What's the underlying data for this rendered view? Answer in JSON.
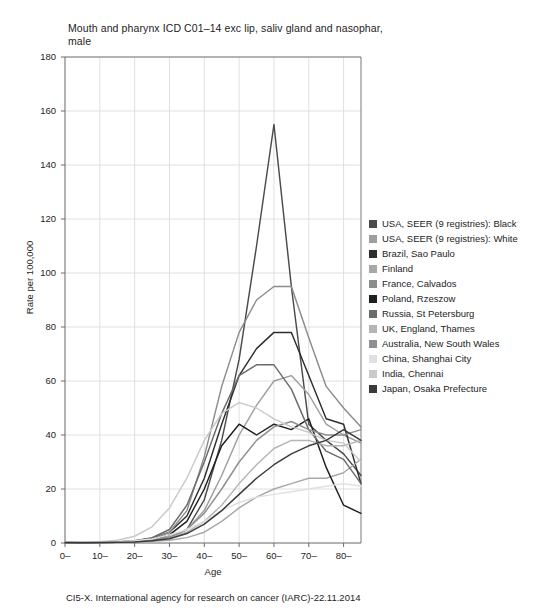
{
  "title": "Mouth and pharynx ICD C01–14 exc lip, saliv gland and nasophar, male",
  "footer": "CI5-X. International agency for research on cancer (IARC)-22.11.2014",
  "axes": {
    "xlabel": "Age",
    "ylabel": "Rate per 100,000",
    "ytick_labels": [
      "180",
      "160",
      "140",
      "120",
      "100",
      "80",
      "60",
      "40",
      "20",
      "0"
    ],
    "xtick_labels": [
      "0–",
      "10–",
      "20–",
      "30–",
      "40–",
      "50–",
      "60–",
      "70–",
      "80–"
    ]
  },
  "chart_data": {
    "type": "line",
    "title": "Mouth and pharynx ICD C01–14 exc lip, saliv gland and nasophar, male",
    "xlabel": "Age",
    "ylabel": "Rate per 100,000",
    "xlim": [
      0,
      85
    ],
    "ylim": [
      0,
      180
    ],
    "yticks": [
      0,
      20,
      40,
      60,
      80,
      100,
      120,
      140,
      160,
      180
    ],
    "xticks": [
      0,
      10,
      20,
      30,
      40,
      50,
      60,
      70,
      80
    ],
    "grid": true,
    "legend_position": "right",
    "x": [
      0,
      5,
      10,
      15,
      20,
      25,
      30,
      35,
      40,
      45,
      50,
      55,
      60,
      65,
      70,
      75,
      80,
      85
    ],
    "series": [
      {
        "name": "USA, SEER (9 registries): Black",
        "color": "#4b4b4b",
        "values": [
          0.2,
          0.2,
          0.3,
          0.3,
          0.5,
          1.0,
          2.0,
          5.0,
          16.0,
          38.0,
          68.0,
          110.0,
          155.0,
          95.0,
          44.0,
          38.0,
          33.0,
          25.0
        ]
      },
      {
        "name": "USA, SEER (9 registries): White",
        "color": "#9e9e9e",
        "values": [
          0.2,
          0.2,
          0.3,
          0.4,
          0.7,
          1.2,
          2.2,
          5.0,
          12.0,
          25.0,
          40.0,
          51.0,
          60.0,
          62.0,
          55.0,
          44.0,
          40.0,
          37.0
        ]
      },
      {
        "name": "Brazil, Sao Paulo",
        "color": "#2e2e2e",
        "values": [
          0.3,
          0.2,
          0.3,
          0.4,
          0.8,
          1.8,
          4.0,
          10.0,
          24.0,
          44.0,
          62.0,
          72.0,
          78.0,
          78.0,
          62.0,
          46.0,
          44.0,
          22.0
        ]
      },
      {
        "name": "Finland",
        "color": "#a8a8a8",
        "values": [
          0.2,
          0.1,
          0.2,
          0.3,
          0.4,
          0.6,
          1.0,
          2.0,
          4.0,
          8.0,
          13.0,
          17.0,
          20.0,
          22.0,
          24.0,
          24.0,
          26.0,
          31.0
        ]
      },
      {
        "name": "France, Calvados",
        "color": "#8c8c8c",
        "values": [
          0.2,
          0.2,
          0.2,
          0.3,
          0.6,
          1.5,
          4.0,
          12.0,
          32.0,
          58.0,
          78.0,
          90.0,
          95.0,
          95.0,
          76.0,
          58.0,
          50.0,
          43.0
        ]
      },
      {
        "name": "Poland, Rzeszow",
        "color": "#1f1f1f",
        "values": [
          0.2,
          0.1,
          0.2,
          0.3,
          0.5,
          1.2,
          3.0,
          8.0,
          20.0,
          36.0,
          44.0,
          40.0,
          44.0,
          42.0,
          46.0,
          28.0,
          14.0,
          11.0
        ]
      },
      {
        "name": "Russia, St Petersburg",
        "color": "#6b6b6b",
        "values": [
          0.2,
          0.2,
          0.3,
          0.4,
          0.8,
          2.0,
          5.0,
          14.0,
          30.0,
          48.0,
          62.0,
          66.0,
          66.0,
          57.0,
          42.0,
          34.0,
          31.0,
          22.0
        ]
      },
      {
        "name": "UK, England, Thames",
        "color": "#b5b5b5",
        "values": [
          0.2,
          0.1,
          0.2,
          0.3,
          0.5,
          1.0,
          2.0,
          4.0,
          8.0,
          14.0,
          22.0,
          29.0,
          35.0,
          38.0,
          38.0,
          36.0,
          36.0,
          38.0
        ]
      },
      {
        "name": "Australia, New South Wales",
        "color": "#8f8f8f",
        "values": [
          0.2,
          0.1,
          0.2,
          0.3,
          0.5,
          1.0,
          2.2,
          5.0,
          11.0,
          20.0,
          30.0,
          38.0,
          43.0,
          45.0,
          42.0,
          40.0,
          40.0,
          42.0
        ]
      },
      {
        "name": "China, Shanghai City",
        "color": "#e0e0e0",
        "values": [
          0.3,
          0.3,
          0.4,
          0.5,
          0.8,
          1.5,
          3.0,
          5.0,
          8.0,
          12.0,
          15.0,
          17.0,
          18.0,
          19.0,
          20.0,
          21.0,
          22.0,
          21.0
        ]
      },
      {
        "name": "India, Chennai",
        "color": "#c9c9c9",
        "values": [
          0.4,
          0.3,
          0.5,
          1.0,
          2.5,
          6.0,
          13.0,
          24.0,
          38.0,
          48.0,
          52.0,
          50.0,
          46.0,
          43.0,
          41.0,
          38.0,
          37.0,
          30.0
        ]
      },
      {
        "name": "Japan, Osaka Prefecture",
        "color": "#3a3a3a",
        "values": [
          0.2,
          0.1,
          0.2,
          0.3,
          0.4,
          0.8,
          1.6,
          3.5,
          7.0,
          12.0,
          18.0,
          24.0,
          29.0,
          33.0,
          36.0,
          38.0,
          42.0,
          38.0
        ]
      }
    ]
  }
}
